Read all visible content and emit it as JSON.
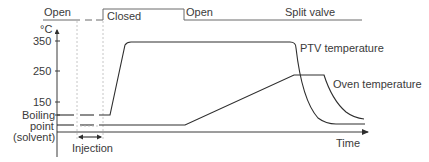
{
  "diagram": {
    "type": "timing-diagram",
    "valve": {
      "title": "Split valve",
      "states": [
        "Open",
        "Closed",
        "Open"
      ]
    },
    "y_axis": {
      "unit": "°C",
      "ticks": [
        "350",
        "250",
        "150"
      ],
      "boiling_label_lines": [
        "Boiling",
        "point",
        "(solvent)"
      ]
    },
    "x_axis": {
      "label": "Time"
    },
    "phase": {
      "label": "Injection"
    },
    "curves": [
      {
        "name": "PTV temperature"
      },
      {
        "name": "Oven temperature"
      }
    ]
  }
}
